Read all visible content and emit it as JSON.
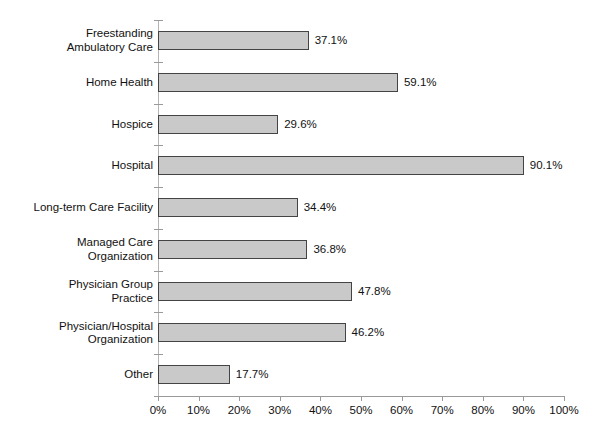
{
  "chart_data": {
    "type": "bar",
    "orientation": "horizontal",
    "title": "",
    "xlabel": "",
    "ylabel": "",
    "xlim": [
      0,
      100
    ],
    "grid": false,
    "legend": false,
    "value_suffix": "%",
    "categories": [
      "Freestanding\nAmbulatory Care",
      "Home Health",
      "Hospice",
      "Hospital",
      "Long-term Care Facility",
      "Managed Care\nOrganization",
      "Physician Group\nPractice",
      "Physician/Hospital\nOrganization",
      "Other"
    ],
    "values": [
      37.1,
      59.1,
      29.6,
      90.1,
      34.4,
      36.8,
      47.8,
      46.2,
      17.7
    ],
    "value_labels": [
      "37.1%",
      "59.1%",
      "29.6%",
      "90.1%",
      "34.4%",
      "36.8%",
      "47.8%",
      "46.2%",
      "17.7%"
    ],
    "xticks": [
      0,
      10,
      20,
      30,
      40,
      50,
      60,
      70,
      80,
      90,
      100
    ],
    "xtick_labels": [
      "0%",
      "10%",
      "20%",
      "30%",
      "40%",
      "50%",
      "60%",
      "70%",
      "80%",
      "90%",
      "100%"
    ],
    "colors": {
      "bar_fill": "#c9c9c9",
      "bar_border": "#444444",
      "axis": "#9a9a9a",
      "text": "#111111",
      "background": "#ffffff"
    }
  }
}
